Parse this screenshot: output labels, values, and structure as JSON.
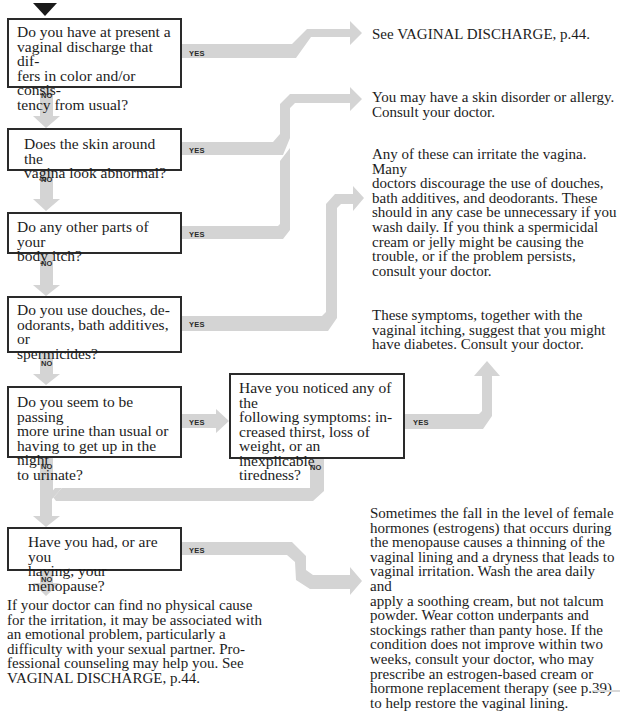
{
  "colors": {
    "arrow": "#d4d4d4",
    "box_border": "#2a2a2a",
    "text": "#1c1c1c",
    "start_marker": "#1a1a1a"
  },
  "labels": {
    "yes": "YES",
    "no": "NO"
  },
  "questions": [
    {
      "id": "q1",
      "text": "Do you have at present a vaginal discharge that differs in color and/or consistency from usual?"
    },
    {
      "id": "q2",
      "text": "Does the skin around the vagina look abnormal?"
    },
    {
      "id": "q3",
      "text": "Do any other parts of your body itch?"
    },
    {
      "id": "q4",
      "text": "Do you use douches, deodorants, bath additives, or spermicides?"
    },
    {
      "id": "q5",
      "text": "Do you seem to be passing more urine than usual or having to get up in the night to urinate?"
    },
    {
      "id": "q6",
      "text": "Have you noticed any of the following symptoms: increased thirst, loss of weight, or an inexplicable tiredness?"
    },
    {
      "id": "q7",
      "text": "Have you had, or are you having, your menopause?"
    }
  ],
  "answers": [
    {
      "id": "a1",
      "text": "See VAGINAL DISCHARGE, p.44."
    },
    {
      "id": "a2",
      "text": "You may have a skin disorder or allergy. Consult your doctor."
    },
    {
      "id": "a3",
      "text": "Any of these can irritate the vagina. Many doctors discourage the use of douches, bath additives, and deodorants. These should in any case be unnecessary if you wash daily. If you think a spermicidal cream or jelly might be causing the trouble, or if the problem persists, consult your doctor."
    },
    {
      "id": "a4",
      "text": "These symptoms, together with the vaginal itching, suggest that you might have diabetes. Consult your doctor."
    },
    {
      "id": "a5",
      "text": "Sometimes the fall in the level of female hormones (estrogens) that occurs during the menopause causes a thinning of the vaginal lining and a dryness that leads to vaginal irritation. Wash the area daily and apply a soothing cream, but not talcum powder. Wear cotton underpants and stockings rather than panty hose. If the condition does not improve within two weeks, consult your doctor, who may prescribe an estrogen-based cream or hormone replacement therapy (see p.39) to help restore the vaginal lining."
    },
    {
      "id": "a6",
      "text": "If your doctor can find no physical cause for the irritation, it may be associated with an emotional problem, particularly a difficulty with your sexual partner. Professional counseling may help you. See VAGINAL DISCHARGE, p.44."
    }
  ],
  "edges": [
    {
      "from": "q1",
      "to": "a1",
      "label": "YES"
    },
    {
      "from": "q1",
      "to": "q2",
      "label": "NO"
    },
    {
      "from": "q2",
      "to": "a2",
      "label": "YES"
    },
    {
      "from": "q2",
      "to": "q3",
      "label": "NO"
    },
    {
      "from": "q3",
      "to": "a3",
      "label": "YES"
    },
    {
      "from": "q3",
      "to": "q4",
      "label": "NO"
    },
    {
      "from": "q4",
      "to": "a3",
      "label": "YES"
    },
    {
      "from": "q4",
      "to": "q5",
      "label": "NO"
    },
    {
      "from": "q5",
      "to": "q6",
      "label": "YES"
    },
    {
      "from": "q5",
      "to": "q7",
      "label": "NO"
    },
    {
      "from": "q6",
      "to": "a4",
      "label": "YES"
    },
    {
      "from": "q6",
      "to": "q7",
      "label": "NO"
    },
    {
      "from": "q7",
      "to": "a5",
      "label": "YES"
    },
    {
      "from": "q7",
      "to": "a6",
      "label": "NO"
    }
  ],
  "display_lines": {
    "q1": [
      "Do you have at present a",
      "vaginal discharge that dif-",
      "fers in color and/or consis-",
      "tency from usual?"
    ],
    "q2": [
      "Does the skin around the",
      "vagina look abnormal?"
    ],
    "q3": [
      "Do any other parts of your",
      "body itch?"
    ],
    "q4": [
      "Do you use douches, de-",
      "odorants, bath additives, or",
      "spermicides?"
    ],
    "q5": [
      "Do you seem to be passing",
      "more urine than usual or",
      "having to get up in the night",
      "to urinate?"
    ],
    "q6": [
      "Have you noticed any of the",
      "following symptoms: in-",
      "creased thirst, loss of",
      "weight, or an inexplicable",
      "tiredness?"
    ],
    "q7": [
      "Have you had, or are you",
      "having, your menopause?"
    ],
    "a1": [
      "See VAGINAL DISCHARGE, p.44."
    ],
    "a2": [
      "You may have a skin disorder or allergy.",
      "Consult your doctor."
    ],
    "a3": [
      "Any of these can irritate the vagina. Many",
      "doctors discourage the use of douches,",
      "bath additives, and deodorants. These",
      "should in any case be unnecessary if you",
      "wash daily. If you think a spermicidal",
      "cream or jelly might be causing the",
      "trouble, or if the problem persists,",
      "consult your doctor."
    ],
    "a4": [
      "These symptoms, together with the",
      "vaginal itching, suggest that you might",
      "have diabetes. Consult your doctor."
    ],
    "a5": [
      "Sometimes the fall in the level of female",
      "hormones (estrogens) that occurs during",
      "the menopause causes a thinning of the",
      "vaginal lining and a dryness that leads to",
      "vaginal irritation. Wash the area daily and",
      "apply a soothing cream, but not talcum",
      "powder. Wear cotton underpants and",
      "stockings rather than panty hose. If the",
      "condition does not improve within two",
      "weeks, consult your doctor, who may",
      "prescribe an estrogen-based cream or",
      "hormone replacement therapy (see p.39)",
      "to help restore the vaginal lining."
    ],
    "a6": [
      "If your doctor can find no physical cause",
      "for the irritation, it may be associated with",
      "an emotional problem, particularly a",
      "difficulty with your sexual partner. Pro-",
      "fessional counseling may help you. See",
      "VAGINAL DISCHARGE, p.44."
    ]
  }
}
